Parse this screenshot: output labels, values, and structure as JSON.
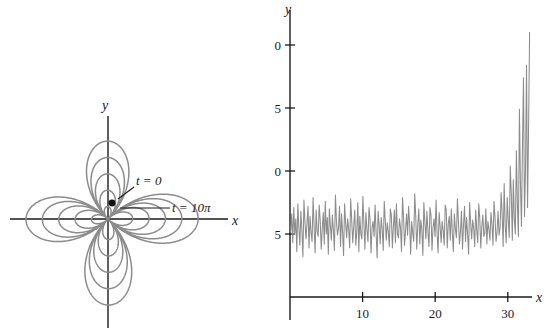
{
  "figure": {
    "background_color": "#ffffff",
    "axis_color": "#1a1a1a",
    "curve_color": "#8c8c8c"
  },
  "panels": [
    {
      "id": "butterfly-curve",
      "xlabel": "x",
      "ylabel": "y",
      "annotations": [
        {
          "id": "t-start",
          "text": "t = 0"
        },
        {
          "id": "t-end",
          "text": "t = 10π"
        }
      ]
    },
    {
      "id": "noisy-series",
      "xlabel": "x",
      "ylabel": "y",
      "xticks": [
        10,
        20,
        30
      ],
      "yticks": [
        5,
        10,
        15,
        20
      ]
    }
  ],
  "chart_data": [
    {
      "type": "line",
      "id": "butterfly-curve",
      "title": "",
      "xlabel": "x",
      "ylabel": "y",
      "grid": false,
      "legend": null,
      "parametric": true,
      "t_range": [
        0,
        31.4159
      ],
      "description": "Four-petal growing rose / butterfly spiral traced from t = 0 at the centre outward to t = 10π",
      "annotations": [
        {
          "text": "t = 0",
          "point_xy": [
            0.12,
            0.42
          ],
          "label_xy": [
            1.05,
            1.02
          ]
        },
        {
          "text": "t = 10π",
          "point_xy": [
            0.55,
            0.18
          ],
          "label_xy": [
            2.3,
            0.42
          ]
        }
      ],
      "xlim": [
        -3.4,
        3.4
      ],
      "ylim": [
        -3.0,
        3.0
      ]
    },
    {
      "type": "line",
      "id": "noisy-series",
      "title": "",
      "xlabel": "x",
      "ylabel": "y",
      "grid": false,
      "legend": null,
      "xlim": [
        0,
        34
      ],
      "ylim": [
        0,
        22
      ],
      "xticks": [
        10,
        20,
        30
      ],
      "yticks": [
        5,
        10,
        15,
        20
      ],
      "x": [
        0.1,
        0.24,
        0.38,
        0.52,
        0.66,
        0.8,
        0.94,
        1.08,
        1.22,
        1.36,
        1.5,
        1.64,
        1.78,
        1.92,
        2.06,
        2.2,
        2.34,
        2.48,
        2.62,
        2.76,
        2.9,
        3.04,
        3.18,
        3.32,
        3.46,
        3.6,
        3.74,
        3.88,
        4.02,
        4.16,
        4.3,
        4.44,
        4.58,
        4.72,
        4.86,
        5.0,
        5.14,
        5.28,
        5.42,
        5.56,
        5.7,
        5.84,
        5.98,
        6.12,
        6.26,
        6.4,
        6.54,
        6.68,
        6.82,
        6.96,
        7.1,
        7.24,
        7.38,
        7.52,
        7.66,
        7.8,
        7.94,
        8.08,
        8.22,
        8.36,
        8.5,
        8.64,
        8.78,
        8.92,
        9.06,
        9.2,
        9.34,
        9.48,
        9.62,
        9.76,
        9.9,
        10.04,
        10.18,
        10.32,
        10.46,
        10.6,
        10.74,
        10.88,
        11.02,
        11.16,
        11.3,
        11.44,
        11.58,
        11.72,
        11.86,
        12.0,
        12.14,
        12.28,
        12.42,
        12.56,
        12.7,
        12.84,
        12.98,
        13.12,
        13.26,
        13.4,
        13.54,
        13.68,
        13.82,
        13.96,
        14.1,
        14.24,
        14.38,
        14.52,
        14.66,
        14.8,
        14.94,
        15.08,
        15.22,
        15.36,
        15.5,
        15.64,
        15.78,
        15.92,
        16.06,
        16.2,
        16.34,
        16.48,
        16.62,
        16.76,
        16.9,
        17.04,
        17.18,
        17.32,
        17.46,
        17.6,
        17.74,
        17.88,
        18.02,
        18.16,
        18.3,
        18.44,
        18.58,
        18.72,
        18.86,
        19.0,
        19.14,
        19.28,
        19.42,
        19.56,
        19.7,
        19.84,
        19.98,
        20.12,
        20.26,
        20.4,
        20.54,
        20.68,
        20.82,
        20.96,
        21.1,
        21.24,
        21.38,
        21.52,
        21.66,
        21.8,
        21.94,
        22.08,
        22.22,
        22.36,
        22.5,
        22.64,
        22.78,
        22.92,
        23.06,
        23.2,
        23.34,
        23.48,
        23.62,
        23.76,
        23.9,
        24.04,
        24.18,
        24.32,
        24.46,
        24.6,
        24.74,
        24.88,
        25.02,
        25.16,
        25.3,
        25.44,
        25.58,
        25.72,
        25.86,
        26.0,
        26.14,
        26.28,
        26.42,
        26.56,
        26.7,
        26.84,
        26.98,
        27.12,
        27.26,
        27.4,
        27.54,
        27.68,
        27.82,
        27.96,
        28.1,
        28.24,
        28.38,
        28.52,
        28.66,
        28.8,
        28.94,
        29.08,
        29.22,
        29.36,
        29.5,
        29.64,
        29.78,
        29.92,
        30.06,
        30.2,
        30.34,
        30.48,
        30.62,
        30.76,
        30.9,
        31.04,
        31.18,
        31.32,
        31.46,
        31.6,
        31.74,
        31.88,
        32.02,
        32.16,
        32.3,
        32.44,
        32.58,
        32.72,
        32.86,
        33.0
      ],
      "y": [
        5.2,
        6.6,
        4.3,
        7.1,
        5.0,
        6.2,
        3.6,
        7.4,
        5.5,
        4.1,
        6.8,
        5.3,
        3.2,
        7.7,
        6.0,
        4.6,
        5.8,
        7.2,
        3.9,
        6.4,
        5.1,
        4.4,
        7.9,
        5.6,
        3.5,
        6.9,
        5.2,
        4.8,
        7.3,
        6.1,
        3.8,
        5.4,
        6.7,
        4.2,
        7.6,
        5.0,
        6.3,
        3.4,
        7.0,
        5.7,
        4.5,
        6.5,
        5.3,
        3.7,
        8.1,
        6.0,
        4.9,
        5.5,
        7.2,
        4.0,
        6.6,
        5.1,
        3.3,
        7.4,
        5.9,
        4.7,
        6.2,
        5.4,
        3.9,
        7.8,
        6.1,
        4.3,
        5.6,
        6.9,
        4.1,
        5.2,
        7.5,
        3.6,
        6.4,
        5.0,
        4.6,
        8.0,
        5.8,
        3.8,
        6.7,
        5.3,
        4.4,
        7.1,
        6.2,
        3.5,
        5.5,
        6.0,
        4.8,
        7.3,
        5.1,
        3.1,
        6.8,
        5.7,
        4.2,
        6.3,
        5.4,
        3.7,
        7.6,
        6.1,
        4.5,
        5.9,
        5.2,
        4.0,
        7.0,
        6.5,
        3.9,
        5.6,
        6.9,
        4.3,
        7.4,
        5.0,
        4.7,
        6.2,
        5.5,
        3.6,
        7.9,
        6.3,
        4.1,
        5.3,
        6.6,
        4.9,
        7.2,
        5.8,
        3.4,
        6.0,
        5.1,
        4.4,
        8.2,
        6.4,
        3.8,
        5.7,
        7.0,
        4.2,
        6.1,
        5.4,
        3.3,
        7.5,
        5.9,
        4.6,
        6.8,
        5.2,
        4.0,
        7.1,
        6.5,
        3.7,
        5.5,
        6.2,
        4.8,
        7.7,
        5.0,
        3.5,
        6.7,
        5.6,
        4.3,
        6.0,
        5.3,
        4.1,
        7.3,
        6.9,
        3.9,
        5.8,
        6.4,
        4.5,
        7.0,
        5.1,
        3.6,
        6.6,
        5.4,
        4.7,
        7.8,
        6.0,
        4.2,
        5.2,
        6.8,
        3.8,
        5.7,
        7.2,
        4.4,
        6.3,
        5.0,
        3.4,
        7.5,
        5.9,
        4.6,
        6.1,
        5.5,
        4.0,
        6.9,
        5.3,
        4.3,
        7.4,
        6.2,
        3.9,
        5.6,
        6.5,
        4.8,
        5.1,
        7.0,
        4.2,
        6.0,
        5.4,
        4.5,
        6.7,
        5.8,
        4.1,
        7.6,
        6.3,
        4.4,
        5.2,
        6.8,
        4.9,
        5.5,
        8.3,
        6.6,
        4.0,
        9.0,
        5.7,
        4.3,
        7.9,
        6.1,
        4.7,
        10.4,
        8.2,
        4.5,
        9.3,
        6.2,
        5.0,
        11.6,
        7.4,
        4.8,
        14.9,
        9.1,
        5.6,
        12.0,
        17.4,
        6.4,
        10.2,
        18.4,
        7.1,
        13.3,
        21.0,
        8.8,
        11.5,
        15.9,
        12.8,
        14.4,
        16.3,
        9.5
      ]
    }
  ]
}
